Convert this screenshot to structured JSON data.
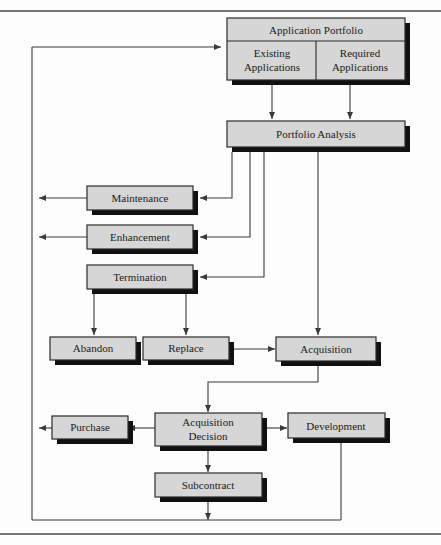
{
  "figure": {
    "type": "flowchart",
    "background_color": "#fdfdfd",
    "box_fill": "#d6d6d6",
    "box_stroke": "#2a2a2a",
    "shadow_color": "#111111",
    "line_color": "#3a3a3a"
  },
  "nodes": {
    "application_portfolio": {
      "label": "Application Portfolio"
    },
    "existing_applications": {
      "label": "Existing\nApplications",
      "line1": "Existing",
      "line2": "Applications"
    },
    "required_applications": {
      "label": "Required\nApplications",
      "line1": "Required",
      "line2": "Applications"
    },
    "portfolio_analysis": {
      "label": "Portfolio Analysis"
    },
    "maintenance": {
      "label": "Maintenance"
    },
    "enhancement": {
      "label": "Enhancement"
    },
    "termination": {
      "label": "Termination"
    },
    "abandon": {
      "label": "Abandon"
    },
    "replace": {
      "label": "Replace"
    },
    "acquisition": {
      "label": "Acquisition"
    },
    "purchase": {
      "label": "Purchase"
    },
    "acquisition_decision": {
      "label": "Acquisition\nDecision",
      "line1": "Acquisition",
      "line2": "Decision"
    },
    "development": {
      "label": "Development"
    },
    "subcontract": {
      "label": "Subcontract"
    }
  },
  "edges": [
    {
      "from": "existing_applications",
      "to": "portfolio_analysis"
    },
    {
      "from": "required_applications",
      "to": "portfolio_analysis"
    },
    {
      "from": "portfolio_analysis",
      "to": "maintenance"
    },
    {
      "from": "portfolio_analysis",
      "to": "enhancement"
    },
    {
      "from": "portfolio_analysis",
      "to": "termination"
    },
    {
      "from": "portfolio_analysis",
      "to": "acquisition"
    },
    {
      "from": "maintenance",
      "to": "feedback_loop"
    },
    {
      "from": "enhancement",
      "to": "feedback_loop"
    },
    {
      "from": "termination",
      "to": "abandon"
    },
    {
      "from": "termination",
      "to": "replace"
    },
    {
      "from": "replace",
      "to": "acquisition"
    },
    {
      "from": "acquisition",
      "to": "acquisition_decision"
    },
    {
      "from": "acquisition_decision",
      "to": "purchase"
    },
    {
      "from": "acquisition_decision",
      "to": "development"
    },
    {
      "from": "acquisition_decision",
      "to": "subcontract"
    },
    {
      "from": "purchase",
      "to": "feedback_loop"
    },
    {
      "from": "development",
      "to": "bottom_return"
    },
    {
      "from": "subcontract",
      "to": "bottom_return"
    },
    {
      "from": "bottom_return",
      "to": "application_portfolio"
    }
  ]
}
